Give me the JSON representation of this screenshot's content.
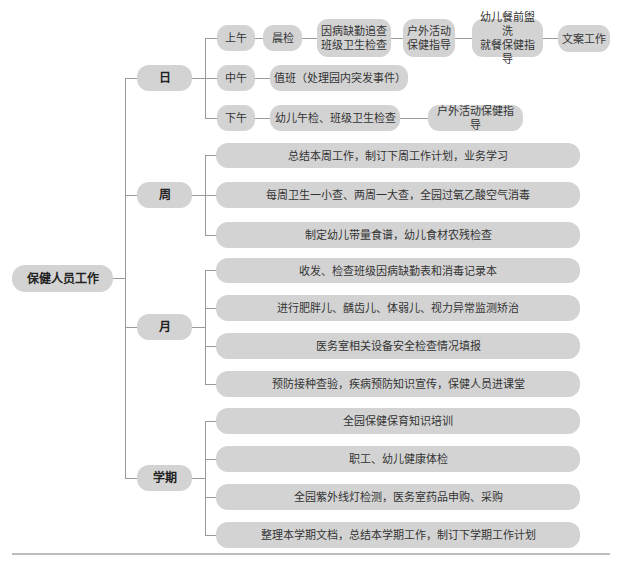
{
  "root": {
    "label": "保健人员工作"
  },
  "daily": {
    "label": "日",
    "morning": {
      "label": "上午",
      "items": [
        "晨检",
        "因病缺勤追查\n班级卫生检查",
        "户外活动\n保健指导",
        "幼儿餐前盥洗\n就餐保健指导",
        "文案工作"
      ]
    },
    "noon": {
      "label": "中午",
      "items": [
        "值班（处理园内突发事件）"
      ]
    },
    "afternoon": {
      "label": "下午",
      "items": [
        "幼儿午检、班级卫生检查",
        "户外活动保健指导"
      ]
    }
  },
  "weekly": {
    "label": "周",
    "items": [
      "总结本周工作，制订下周工作计划，业务学习",
      "每周卫生一小查、两周一大查，全园过氧乙酸空气消毒",
      "制定幼儿带量食谱，幼儿食材农残检查"
    ]
  },
  "monthly": {
    "label": "月",
    "items": [
      "收发、检查班级因病缺勤表和消毒记录本",
      "进行肥胖儿、龋齿儿、体弱儿、视力异常监测矫治",
      "医务室相关设备安全检查情况填报",
      "预防接种查验，疾病预防知识宣传，保健人员进课堂"
    ]
  },
  "semester": {
    "label": "学期",
    "items": [
      "全园保健保育知识培训",
      "职工、幼儿健康体检",
      "全园紫外线灯检测，医务室药品申购、采购",
      "整理本学期文档，总结本学期工作，制订下学期工作计划"
    ]
  },
  "colors": {
    "node_fill": "#d3d3d3",
    "line": "#9a9a9a",
    "text": "#333333",
    "rule": "#bdbdbd"
  }
}
